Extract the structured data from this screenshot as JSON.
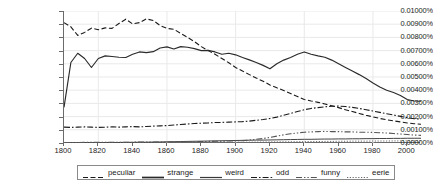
{
  "chart_data": {
    "type": "line",
    "title": "",
    "xlabel": "",
    "ylabel": "",
    "grid": true,
    "legend_position": "bottom",
    "xlim": [
      1800,
      2008
    ],
    "ylim": [
      0,
      0.01
    ],
    "y_tick_labels": [
      "0.01000%",
      "0.00900%",
      "0.00800%",
      "0.00700%",
      "0.00600%",
      "0.00500%",
      "0.00400%",
      "0.00300%",
      "0.00200%",
      "0.00100%",
      "0.00000%"
    ],
    "y_tick_values": [
      0.01,
      0.009,
      0.008,
      0.007,
      0.006,
      0.005,
      0.004,
      0.003,
      0.002,
      0.001,
      0
    ],
    "x_tick_labels": [
      "1800",
      "1820",
      "1840",
      "1860",
      "1880",
      "1900",
      "1920",
      "1940",
      "1960",
      "1980",
      "2000"
    ],
    "x_tick_values": [
      1800,
      1820,
      1840,
      1860,
      1880,
      1900,
      1920,
      1940,
      1960,
      1980,
      2000
    ],
    "x": [
      1800,
      1804,
      1808,
      1812,
      1816,
      1820,
      1824,
      1828,
      1832,
      1836,
      1840,
      1844,
      1848,
      1852,
      1856,
      1860,
      1864,
      1868,
      1872,
      1876,
      1880,
      1884,
      1888,
      1892,
      1896,
      1900,
      1904,
      1908,
      1912,
      1916,
      1920,
      1924,
      1928,
      1932,
      1936,
      1940,
      1944,
      1948,
      1952,
      1956,
      1960,
      1964,
      1968,
      1972,
      1976,
      1980,
      1984,
      1988,
      1992,
      1996,
      2000,
      2004,
      2008
    ],
    "series": [
      {
        "name": "peculiar",
        "style": "dashed",
        "color": "#1a1a1a",
        "values": [
          0.00912,
          0.0088,
          0.00815,
          0.00838,
          0.0087,
          0.00858,
          0.00872,
          0.00868,
          0.00905,
          0.00938,
          0.00902,
          0.00912,
          0.0094,
          0.00928,
          0.0089,
          0.00868,
          0.00862,
          0.0083,
          0.008,
          0.00768,
          0.0073,
          0.007,
          0.00672,
          0.0064,
          0.00608,
          0.00572,
          0.00545,
          0.00518,
          0.00492,
          0.00468,
          0.0044,
          0.00418,
          0.00398,
          0.00375,
          0.00352,
          0.0033,
          0.00318,
          0.00308,
          0.00296,
          0.00282,
          0.00268,
          0.00252,
          0.00238,
          0.00224,
          0.0021,
          0.00198,
          0.00186,
          0.00176,
          0.00168,
          0.0016,
          0.00152,
          0.00146,
          0.00142
        ]
      },
      {
        "name": "strange",
        "style": "solid",
        "color": "#2a2a2a",
        "values": [
          0.0027,
          0.0061,
          0.0068,
          0.0064,
          0.00572,
          0.0064,
          0.0066,
          0.00655,
          0.0065,
          0.00648,
          0.00672,
          0.0069,
          0.00685,
          0.00692,
          0.0072,
          0.00728,
          0.00712,
          0.0073,
          0.00725,
          0.00715,
          0.007,
          0.00702,
          0.0069,
          0.00672,
          0.0068,
          0.00668,
          0.00648,
          0.0063,
          0.0061,
          0.00588,
          0.00562,
          0.006,
          0.00628,
          0.00648,
          0.00672,
          0.0069,
          0.00672,
          0.0066,
          0.0065,
          0.00628,
          0.006,
          0.00572,
          0.00545,
          0.00518,
          0.00488,
          0.00455,
          0.00425,
          0.004,
          0.00382,
          0.0036,
          0.0033,
          0.00318,
          0.00316
        ]
      },
      {
        "name": "weird",
        "style": "solid-thin",
        "color": "#3a3a3a",
        "values": [
          2e-05,
          2e-05,
          2e-05,
          3e-05,
          3e-05,
          3e-05,
          4e-05,
          4e-05,
          4e-05,
          5e-05,
          5e-05,
          6e-05,
          6e-05,
          7e-05,
          8e-05,
          9e-05,
          0.0001,
          0.00011,
          0.00012,
          0.00013,
          0.00014,
          0.00015,
          0.00016,
          0.00017,
          0.00018,
          0.00019,
          0.0002,
          0.00021,
          0.00022,
          0.00022,
          0.00023,
          0.00024,
          0.00025,
          0.00026,
          0.00027,
          0.00028,
          0.00028,
          0.00029,
          0.0003,
          0.0003,
          0.00031,
          0.00031,
          0.00032,
          0.00032,
          0.00033,
          0.00033,
          0.00034,
          0.00034,
          0.00035,
          0.00035,
          0.00036,
          0.00036,
          0.00036
        ]
      },
      {
        "name": "odd",
        "style": "dash-dot",
        "color": "#1a1a1a",
        "values": [
          0.0012,
          0.00118,
          0.0012,
          0.00122,
          0.0012,
          0.00118,
          0.0012,
          0.00122,
          0.0012,
          0.00122,
          0.00124,
          0.00122,
          0.00125,
          0.00128,
          0.0013,
          0.00132,
          0.00136,
          0.0014,
          0.00144,
          0.00148,
          0.0015,
          0.00152,
          0.00155,
          0.00156,
          0.00158,
          0.0016,
          0.00162,
          0.00166,
          0.00172,
          0.00178,
          0.00186,
          0.00196,
          0.0021,
          0.00224,
          0.00238,
          0.00252,
          0.00262,
          0.00268,
          0.00274,
          0.00278,
          0.0028,
          0.00276,
          0.0027,
          0.00262,
          0.00252,
          0.00242,
          0.00232,
          0.00222,
          0.00212,
          0.00202,
          0.00192,
          0.00184,
          0.0018
        ]
      },
      {
        "name": "funny",
        "style": "dash-dot-dot",
        "color": "#555555",
        "values": [
          4e-05,
          4e-05,
          4e-05,
          5e-05,
          5e-05,
          5e-05,
          5e-05,
          6e-05,
          6e-05,
          6e-05,
          6e-05,
          7e-05,
          7e-05,
          7e-05,
          8e-05,
          8e-05,
          9e-05,
          9e-05,
          0.0001,
          0.0001,
          0.00011,
          0.00012,
          0.00013,
          0.00014,
          0.00015,
          0.00016,
          0.00018,
          0.00022,
          0.00028,
          0.00034,
          0.00042,
          0.00052,
          0.00062,
          0.0007,
          0.00076,
          0.00082,
          0.00084,
          0.00086,
          0.00088,
          0.00086,
          0.00086,
          0.00084,
          0.00084,
          0.00082,
          0.00082,
          0.0008,
          0.00078,
          0.00076,
          0.00072,
          0.00068,
          0.00064,
          0.0006,
          0.00058
        ]
      },
      {
        "name": "eerie",
        "style": "dotted",
        "color": "#666666",
        "values": [
          1e-05,
          1e-05,
          1e-05,
          1e-05,
          1e-05,
          1e-05,
          1e-05,
          1e-05,
          1e-05,
          2e-05,
          2e-05,
          2e-05,
          2e-05,
          2e-05,
          2e-05,
          3e-05,
          3e-05,
          3e-05,
          3e-05,
          4e-05,
          4e-05,
          4e-05,
          5e-05,
          5e-05,
          5e-05,
          6e-05,
          6e-05,
          6e-05,
          7e-05,
          7e-05,
          8e-05,
          8e-05,
          9e-05,
          9e-05,
          0.0001,
          0.0001,
          0.00011,
          0.00011,
          0.00012,
          0.00012,
          0.00013,
          0.00013,
          0.00014,
          0.00014,
          0.00014,
          0.00015,
          0.00015,
          0.00015,
          0.00016,
          0.00016,
          0.00016,
          0.00016,
          0.00016
        ]
      }
    ]
  },
  "legend": {
    "entries": [
      {
        "label": "peculiar",
        "style": "dashed"
      },
      {
        "label": "strange",
        "style": "solid"
      },
      {
        "label": "weird",
        "style": "solid-thin"
      },
      {
        "label": "odd",
        "style": "dash-dot"
      },
      {
        "label": "funny",
        "style": "dash-dot-dot"
      },
      {
        "label": "eerie",
        "style": "dotted"
      }
    ]
  }
}
